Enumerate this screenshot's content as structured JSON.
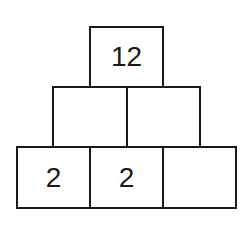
{
  "pyramid": {
    "rows": [
      {
        "cells": [
          {
            "value": "12"
          }
        ]
      },
      {
        "cells": [
          {
            "value": ""
          },
          {
            "value": ""
          }
        ]
      },
      {
        "cells": [
          {
            "value": "2"
          },
          {
            "value": "2"
          },
          {
            "value": ""
          }
        ]
      }
    ]
  }
}
